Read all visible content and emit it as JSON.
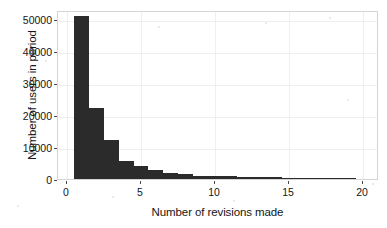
{
  "chart_data": {
    "type": "bar",
    "title": "",
    "subtitle": "",
    "xlabel": "Number of revisions made",
    "ylabel": "Number of users in period",
    "xlim": [
      0,
      20.5
    ],
    "ylim": [
      0,
      53000
    ],
    "xticks": [
      0,
      5,
      10,
      15,
      20
    ],
    "xtick_labels": [
      "0",
      "5",
      "10",
      "15",
      "20"
    ],
    "yticks": [
      0,
      10000,
      20000,
      30000,
      40000,
      50000
    ],
    "ytick_labels": [
      "0",
      "10000",
      "20000",
      "30000",
      "40000",
      "50000"
    ],
    "grid": true,
    "legend": null,
    "bar_color": "#2b2b2b",
    "bin_width": 1,
    "bin_starts": [
      0.5,
      1.5,
      2.5,
      3.5,
      4.5,
      5.5,
      6.5,
      7.5,
      8.5,
      9.5,
      10.5,
      11.5,
      12.5,
      13.5,
      14.5,
      15.5,
      16.5,
      17.5,
      18.5
    ],
    "categories": [
      "1",
      "2",
      "3",
      "4",
      "5",
      "6",
      "7",
      "8",
      "9",
      "10",
      "11",
      "12",
      "13",
      "14",
      "15",
      "16",
      "17",
      "18",
      "19"
    ],
    "values": [
      50800,
      22300,
      12200,
      5600,
      4000,
      2700,
      2000,
      1500,
      1050,
      900,
      800,
      700,
      600,
      500,
      430,
      360,
      300,
      250,
      200
    ],
    "annotations": []
  },
  "figure": {
    "background_color": "#ffffff",
    "axes_frame_color": "#d4d4d4",
    "gridline_color": "#efefef",
    "tick_color": "#4a4a4a",
    "text_color": "#151515"
  }
}
